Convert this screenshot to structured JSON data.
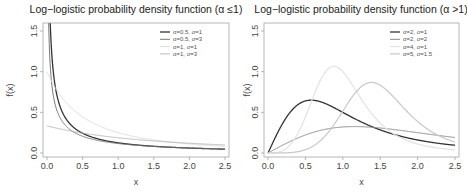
{
  "chart_data": [
    {
      "type": "line",
      "title": "Log−logistic probability density function (α ≤1)",
      "xlabel": "x",
      "ylabel": "f(x)",
      "xlim": [
        0,
        2.5
      ],
      "ylim": [
        0,
        1.5
      ],
      "xticks": [
        "0.0",
        "0.5",
        "1.0",
        "1.5",
        "2.0",
        "2.5"
      ],
      "yticks": [
        "0.0",
        "0.5",
        "1.0",
        "1.5"
      ],
      "legend_position": "top-right",
      "series": [
        {
          "name": "α=0.5, σ=1",
          "alpha": 0.5,
          "sigma": 1,
          "color": "#333333",
          "width": 1.3
        },
        {
          "name": "α=0.5, σ=3",
          "alpha": 0.5,
          "sigma": 3,
          "color": "#777777",
          "width": 1.0
        },
        {
          "name": "α=1, σ=1",
          "alpha": 1,
          "sigma": 1,
          "color": "#dddddd",
          "width": 1.0
        },
        {
          "name": "α=1, σ=3",
          "alpha": 1,
          "sigma": 3,
          "color": "#aaaaaa",
          "width": 0.8
        }
      ]
    },
    {
      "type": "line",
      "title": "Log−logistic probability density function (α >1)",
      "xlabel": "x",
      "ylabel": "f(x)",
      "xlim": [
        0,
        2.5
      ],
      "ylim": [
        0,
        1.5
      ],
      "xticks": [
        "0.0",
        "0.5",
        "1.0",
        "1.5",
        "2.0",
        "2.5"
      ],
      "yticks": [
        "0.0",
        "0.5",
        "1.0",
        "1.5"
      ],
      "legend_position": "top-right",
      "series": [
        {
          "name": "α=2, σ=1",
          "alpha": 2,
          "sigma": 1,
          "color": "#333333",
          "width": 1.3
        },
        {
          "name": "α=2, σ=2",
          "alpha": 2,
          "sigma": 2,
          "color": "#888888",
          "width": 1.0
        },
        {
          "name": "α=4, σ=1",
          "alpha": 4,
          "sigma": 1,
          "color": "#e2e2e2",
          "width": 1.2
        },
        {
          "name": "α=5, σ=1.5",
          "alpha": 5,
          "sigma": 1.5,
          "color": "#c8c8c8",
          "width": 1.2
        }
      ]
    }
  ]
}
